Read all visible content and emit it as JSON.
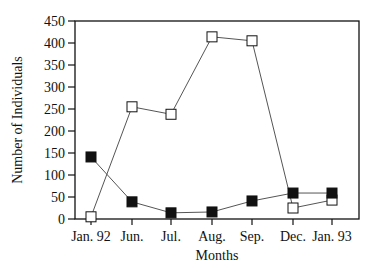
{
  "chart_data": {
    "type": "line",
    "title": "",
    "xlabel": "Months",
    "ylabel": "Number of Individuals",
    "categories": [
      "Jan. 92",
      "Jun.",
      "Jul.",
      "Aug.",
      "Sep.",
      "Dec.",
      "Jan. 93"
    ],
    "ylim": [
      0,
      450
    ],
    "yticks": [
      0,
      50,
      100,
      150,
      200,
      250,
      300,
      350,
      400,
      450
    ],
    "grid": false,
    "legend": "none",
    "series": [
      {
        "name": "Open squares",
        "marker": "open-square",
        "values": [
          5,
          255,
          238,
          414,
          405,
          25,
          43
        ]
      },
      {
        "name": "Filled squares",
        "marker": "filled-square",
        "values": [
          141,
          39,
          14,
          16,
          41,
          59,
          59
        ]
      }
    ]
  },
  "colors": {
    "line": "#555555",
    "frame": "#111111",
    "marker_fill": "#111111",
    "background": "#ffffff"
  }
}
